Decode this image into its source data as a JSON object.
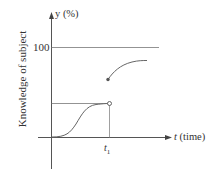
{
  "diagram": {
    "y_axis_label": "Knowledge of subject",
    "y_axis_unit": "y (%)",
    "y_tick": "100",
    "x_axis_unit_var": "t",
    "x_axis_unit_text": "(time)",
    "x_tick_var": "t",
    "x_tick_sub": "1",
    "colors": {
      "line": "#555555",
      "curve": "#666666",
      "text": "#333333"
    }
  }
}
